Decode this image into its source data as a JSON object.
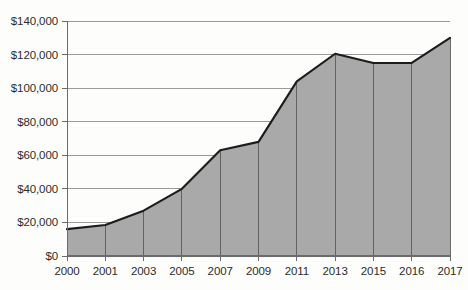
{
  "chart_data": {
    "type": "area",
    "title": "",
    "subtitle": "",
    "xlabel": "",
    "ylabel": "",
    "x": [
      "2000",
      "2001",
      "2003",
      "2005",
      "2007",
      "2009",
      "2011",
      "2013",
      "2015",
      "2016",
      "2017"
    ],
    "categories": [
      "2000",
      "2001",
      "2003",
      "2005",
      "2007",
      "2009",
      "2011",
      "2013",
      "2015",
      "2016",
      "2017"
    ],
    "values": [
      16000,
      18500,
      27000,
      40000,
      63000,
      68000,
      104000,
      120500,
      115000,
      115000,
      130000
    ],
    "series": [
      {
        "name": "",
        "values": [
          16000,
          18500,
          27000,
          40000,
          63000,
          68000,
          104000,
          120500,
          115000,
          115000,
          130000
        ]
      }
    ],
    "ylim": [
      0,
      140000
    ],
    "y_ticks": [
      0,
      20000,
      40000,
      60000,
      80000,
      100000,
      120000,
      140000
    ],
    "y_tick_labels": [
      "$0",
      "$20,000",
      "$40,000",
      "$60,000",
      "$80,000",
      "$100,000",
      "$120,000",
      "$140,000"
    ],
    "x_tick_labels": [
      "2000",
      "2001",
      "2003",
      "2005",
      "2007",
      "2009",
      "2011",
      "2013",
      "2015",
      "2016",
      "2017"
    ],
    "grid": {
      "horizontal": true,
      "vertical": true
    },
    "legend": {
      "visible": false,
      "position": "none",
      "entries": []
    },
    "annotations": [],
    "colors": {
      "area_fill": "#a9a9a9",
      "line": "#1c1c1c",
      "horizontal_gridline": "#8f8f8f",
      "vertical_gridline": "#5a5a5a",
      "axis": "#6b6b6b",
      "tick_text": "#2c2c2c",
      "background": "#fdfdfb"
    }
  },
  "axis": {
    "y_labels": [
      "$140,000",
      "$120,000",
      "$100,000",
      "$80,000",
      "$60,000",
      "$40,000",
      "$20,000",
      "$0"
    ],
    "x_labels": [
      "2000",
      "2001",
      "2003",
      "2005",
      "2007",
      "2009",
      "2011",
      "2013",
      "2015",
      "2016",
      "2017"
    ]
  }
}
